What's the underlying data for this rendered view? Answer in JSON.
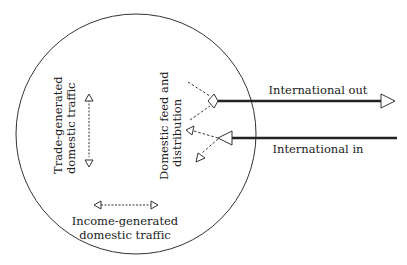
{
  "diagram": {
    "type": "flow-diagram",
    "colors": {
      "stroke": "#222222",
      "background": "#ffffff"
    },
    "labels": {
      "trade_line1": "Trade-generated",
      "trade_line2": "domestic traffic",
      "feed_line1": "Domestic feed and",
      "feed_line2": "distribution",
      "income_line1": "Income-generated",
      "income_line2": "domestic traffic",
      "international_out": "International out",
      "international_in": "International in"
    }
  }
}
